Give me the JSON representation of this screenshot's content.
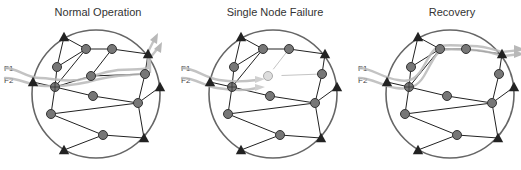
{
  "colors": {
    "ring": "#666666",
    "edge": "#222222",
    "node_fill": "#777777",
    "node_stroke": "#333333",
    "triangle": "#222222",
    "flow": "#b8b8b8",
    "flow_dim": "#d0d0d0",
    "failed_fill": "#dddddd",
    "failed_stroke": "#aaaaaa",
    "failed_edge": "#c4c4c4",
    "title": "#333333"
  },
  "panels": [
    {
      "id": "normal",
      "title": "Normal Operation",
      "dx": 0,
      "flow_labels": [
        "F1",
        "F2"
      ],
      "failed_node": null,
      "flows": [
        "M5,68 C18,68 26,78 40,78 C52,78 62,82 78,80 C95,77 98,72 118,70 C132,69 142,70 148,68 L148,52 L154,40",
        "M5,78 C20,78 30,86 45,86 C60,86 70,86 88,82 C98,79 110,76 130,75 C140,74 146,74 150,72 L150,58 L158,48"
      ]
    },
    {
      "id": "failure",
      "title": "Single Node Failure",
      "dx": 177,
      "flow_labels": [
        "F1",
        "F2"
      ],
      "failed_node": "D",
      "flows": [
        "M5,68 C18,68 28,78 42,80 C55,82 65,82 80,80",
        "M5,78 C18,78 28,86 40,88 C52,90 66,92 80,88"
      ]
    },
    {
      "id": "recovery",
      "title": "Recovery",
      "dx": 354,
      "flow_labels": [
        "F1",
        "F2"
      ],
      "failed_node": "D",
      "flows": [
        "M5,68 C18,68 28,78 44,80 C54,82 60,80 66,72 C74,60 78,48 86,46 C95,44 106,46 118,46 C132,46 140,50 148,52 L166,50",
        "M5,78 C18,78 28,86 42,88 C56,90 64,86 70,76 C78,62 82,52 88,50 C96,48 106,50 118,50 C132,50 140,54 150,56 L166,54"
      ]
    }
  ],
  "ring": {
    "cx": 96,
    "cy": 94,
    "r": 64
  },
  "nodes": {
    "A": {
      "type": "circle",
      "x": 86,
      "y": 49
    },
    "B": {
      "type": "circle",
      "x": 112,
      "y": 49
    },
    "C": {
      "type": "circle",
      "x": 57,
      "y": 67
    },
    "D": {
      "type": "circle",
      "x": 91,
      "y": 76
    },
    "E": {
      "type": "circle",
      "x": 145,
      "y": 74
    },
    "F": {
      "type": "hub",
      "x": 55,
      "y": 87
    },
    "G": {
      "type": "circle",
      "x": 93,
      "y": 96
    },
    "H": {
      "type": "circle",
      "x": 138,
      "y": 103
    },
    "I": {
      "type": "circle",
      "x": 51,
      "y": 114
    },
    "J": {
      "type": "circle",
      "x": 103,
      "y": 135
    },
    "T1": {
      "type": "triangle",
      "x": 64,
      "y": 37
    },
    "T2": {
      "type": "triangle",
      "x": 148,
      "y": 54
    },
    "T3": {
      "type": "triangle",
      "x": 160,
      "y": 87
    },
    "T4": {
      "type": "triangle",
      "x": 144,
      "y": 138
    },
    "T5": {
      "type": "triangle",
      "x": 64,
      "y": 150
    },
    "T6": {
      "type": "triangle",
      "x": 33,
      "y": 82
    }
  },
  "edges": [
    [
      "T1",
      "A"
    ],
    [
      "T1",
      "C"
    ],
    [
      "A",
      "C"
    ],
    [
      "A",
      "F"
    ],
    [
      "C",
      "F"
    ],
    [
      "A",
      "B"
    ],
    [
      "B",
      "D"
    ],
    [
      "B",
      "T2"
    ],
    [
      "D",
      "E"
    ],
    [
      "D",
      "F"
    ],
    [
      "T2",
      "E"
    ],
    [
      "E",
      "H"
    ],
    [
      "H",
      "T3"
    ],
    [
      "F",
      "G"
    ],
    [
      "G",
      "H"
    ],
    [
      "F",
      "T6"
    ],
    [
      "F",
      "I"
    ],
    [
      "I",
      "H"
    ],
    [
      "I",
      "J"
    ],
    [
      "J",
      "T4"
    ],
    [
      "H",
      "T4"
    ],
    [
      "J",
      "T5"
    ]
  ],
  "failure_dim_edges": [
    [
      "B",
      "D"
    ],
    [
      "D",
      "E"
    ]
  ]
}
